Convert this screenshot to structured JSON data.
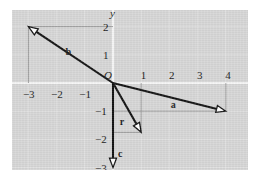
{
  "figure": {
    "kind": "vector-diagram",
    "panel_background": "#d6d6d6",
    "page_background": "#ffffff",
    "axis_color": "#ffffff",
    "grid_color": "#e8e8e8",
    "vector_color": "#111111",
    "guide_color": "#8a8a8a",
    "arrowhead_fill": "#ffffff"
  },
  "axes": {
    "x_label": "x",
    "y_label": "y",
    "origin_label": "O",
    "x_ticks": [
      {
        "value": -3,
        "label": "−3"
      },
      {
        "value": -2,
        "label": "−2"
      },
      {
        "value": -1,
        "label": "−1"
      },
      {
        "value": 1,
        "label": "1"
      },
      {
        "value": 2,
        "label": "2"
      },
      {
        "value": 3,
        "label": "3"
      },
      {
        "value": 4,
        "label": "4"
      }
    ],
    "y_ticks": [
      {
        "value": 2,
        "label": "2"
      },
      {
        "value": 1,
        "label": "1"
      },
      {
        "value": -1,
        "label": "−1"
      },
      {
        "value": -2,
        "label": "−2"
      },
      {
        "value": -3,
        "label": "−3"
      }
    ],
    "xlim": [
      -3.9,
      4.9
    ],
    "ylim": [
      -3.4,
      2.7
    ]
  },
  "vectors": [
    {
      "name": "a",
      "label": "a",
      "x": 4.0,
      "y": -1.0,
      "label_x": 2.05,
      "label_y": -0.62
    },
    {
      "name": "b",
      "label": "b",
      "x": -3.0,
      "y": 2.0,
      "label_x": -1.68,
      "label_y": 1.28
    },
    {
      "name": "c",
      "label": "c",
      "x": 0.0,
      "y": -3.0,
      "label_x": 0.18,
      "label_y": -2.35
    },
    {
      "name": "r",
      "label": "r",
      "x": 1.0,
      "y": -1.75,
      "label_x": 0.24,
      "label_y": -1.22
    }
  ],
  "chart_data": {
    "type": "scatter",
    "title": "",
    "xlabel": "x",
    "ylabel": "y",
    "xlim": [
      -3.9,
      4.9
    ],
    "ylim": [
      -3.4,
      2.7
    ],
    "grid": true,
    "legend": "none",
    "series": [
      {
        "name": "a",
        "values": [
          [
            0,
            0
          ],
          [
            4,
            -1
          ]
        ]
      },
      {
        "name": "b",
        "values": [
          [
            0,
            0
          ],
          [
            -3,
            2
          ]
        ]
      },
      {
        "name": "c",
        "values": [
          [
            0,
            0
          ],
          [
            0,
            -3
          ]
        ]
      },
      {
        "name": "r",
        "values": [
          [
            0,
            0
          ],
          [
            1,
            -1.75
          ]
        ]
      }
    ],
    "annotations": [
      "a",
      "b",
      "c",
      "r",
      "O",
      "x",
      "y"
    ]
  }
}
